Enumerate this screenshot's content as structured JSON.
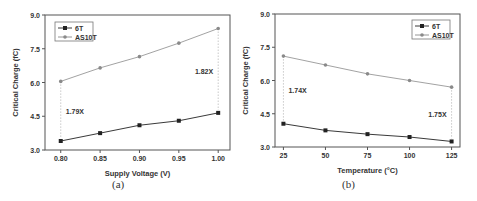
{
  "chart_data": [
    {
      "type": "line",
      "panel_label": "(a)",
      "title": "",
      "xlabel": "Supply Voltage (V)",
      "ylabel": "Critical Charge (fC)",
      "x": [
        0.8,
        0.85,
        0.9,
        0.95,
        1.0
      ],
      "x_tick_labels": [
        "0.80",
        "0.85",
        "0.90",
        "0.95",
        "1.00"
      ],
      "xlim": [
        0.78,
        1.015
      ],
      "ylim": [
        3.0,
        9.0
      ],
      "y_ticks": [
        3.0,
        4.5,
        6.0,
        7.5,
        9.0
      ],
      "y_tick_labels": [
        "3.0",
        "4.5",
        "6.0",
        "7.5",
        "9.0"
      ],
      "legend_position": "upper left",
      "grid": false,
      "series": [
        {
          "name": "6T",
          "marker": "square",
          "color": "#222222",
          "values": [
            3.4,
            3.75,
            4.1,
            4.3,
            4.65
          ]
        },
        {
          "name": "AS10T",
          "marker": "circle",
          "color": "#8a8a8a",
          "values": [
            6.05,
            6.65,
            7.15,
            7.75,
            8.4
          ]
        }
      ],
      "annotations": [
        {
          "text": "1.79X",
          "x_index": 0
        },
        {
          "text": "1.82X",
          "x_index": 4
        }
      ]
    },
    {
      "type": "line",
      "panel_label": "(b)",
      "title": "",
      "xlabel": "Temperature (°C)",
      "ylabel": "Critical Charge (fC)",
      "x": [
        25,
        50,
        75,
        100,
        125
      ],
      "x_tick_labels": [
        "25",
        "50",
        "75",
        "100",
        "125"
      ],
      "xlim": [
        20,
        130
      ],
      "ylim": [
        3.0,
        9.0
      ],
      "y_ticks": [
        3.0,
        4.5,
        6.0,
        7.5,
        9.0
      ],
      "y_tick_labels": [
        "3.0",
        "4.5",
        "6.0",
        "7.5",
        "9.0"
      ],
      "legend_position": "upper right",
      "grid": false,
      "series": [
        {
          "name": "6T",
          "marker": "square",
          "color": "#222222",
          "values": [
            4.05,
            3.75,
            3.58,
            3.45,
            3.25
          ]
        },
        {
          "name": "AS10T",
          "marker": "circle",
          "color": "#8a8a8a",
          "values": [
            7.1,
            6.7,
            6.3,
            6.0,
            5.7
          ]
        }
      ],
      "annotations": [
        {
          "text": "1.74X",
          "x_index": 0
        },
        {
          "text": "1.75X",
          "x_index": 4
        }
      ]
    }
  ]
}
